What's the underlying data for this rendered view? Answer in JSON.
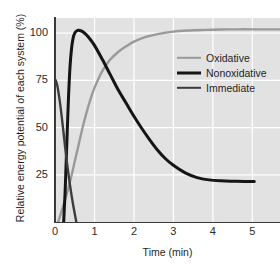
{
  "chart_data": {
    "type": "line",
    "title": "",
    "xlabel": "Time (min)",
    "ylabel": "Relative energy potential of each system (%)",
    "xlim": [
      0,
      5.7
    ],
    "ylim": [
      0,
      108
    ],
    "xticks": [
      "0",
      "1",
      "2",
      "3",
      "4",
      "5"
    ],
    "xtick_values": [
      0,
      1,
      2,
      3,
      4,
      5
    ],
    "yticks": [
      "100",
      "75",
      "50",
      "25"
    ],
    "ytick_values": [
      100,
      75,
      50,
      25
    ],
    "grid": true,
    "grid_color": "#ffffff",
    "plot_background": "#e2e2e2",
    "legend_position": "center-right",
    "series": [
      {
        "name": "Oxidative",
        "color": "#9a9a9a",
        "width": 2.4,
        "x": [
          0.08,
          0.2,
          0.3,
          0.4,
          0.5,
          0.6,
          0.7,
          0.8,
          0.9,
          1.0,
          1.2,
          1.4,
          1.6,
          1.8,
          2.0,
          2.3,
          2.6,
          3.0,
          3.4,
          3.8,
          4.2,
          4.6,
          5.0,
          5.4,
          5.7
        ],
        "y": [
          0,
          8,
          15,
          23,
          32,
          41,
          50,
          58,
          65,
          71,
          80,
          86,
          90,
          93,
          95.5,
          98,
          99.5,
          100.8,
          101.4,
          101.7,
          101.9,
          102,
          102,
          102,
          102
        ]
      },
      {
        "name": "Nonoxidative",
        "color": "#151515",
        "width": 3.0,
        "x": [
          0.22,
          0.26,
          0.3,
          0.34,
          0.38,
          0.42,
          0.46,
          0.5,
          0.55,
          0.6,
          0.7,
          0.8,
          0.9,
          1.0,
          1.2,
          1.4,
          1.6,
          1.8,
          2.0,
          2.2,
          2.4,
          2.6,
          2.8,
          3.0,
          3.3,
          3.6,
          3.9,
          4.2,
          4.5,
          4.8,
          5.05
        ],
        "y": [
          0,
          18,
          42,
          65,
          82,
          92,
          97.5,
          100,
          101.2,
          101.5,
          100.8,
          99,
          96.5,
          93.5,
          86,
          78,
          70,
          63,
          56,
          49.5,
          43.5,
          38,
          33.5,
          30,
          26,
          23.5,
          22.3,
          21.8,
          21.6,
          21.5,
          21.5
        ]
      },
      {
        "name": "Immediate",
        "color": "#3d3d3d",
        "width": 2.4,
        "x": [
          0.02,
          0.06,
          0.1,
          0.14,
          0.18,
          0.22,
          0.26,
          0.3,
          0.34,
          0.38,
          0.42,
          0.46,
          0.5,
          0.54
        ],
        "y": [
          75,
          72,
          67,
          61,
          54,
          46.5,
          39,
          32,
          25.5,
          19.5,
          14,
          9,
          4.5,
          0
        ]
      }
    ]
  },
  "legend": {
    "items": [
      {
        "label": "Oxidative"
      },
      {
        "label": "Nonoxidative"
      },
      {
        "label": "Immediate"
      }
    ]
  }
}
